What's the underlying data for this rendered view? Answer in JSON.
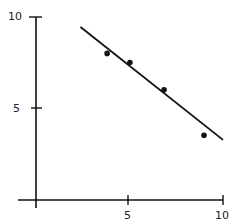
{
  "chart_data": {
    "type": "scatter",
    "title": "",
    "xlabel": "",
    "ylabel": "",
    "xlim": [
      0,
      10
    ],
    "ylim": [
      0,
      10
    ],
    "grid": false,
    "x_ticks": [
      "5",
      "10"
    ],
    "y_ticks": [
      "5",
      "10"
    ],
    "series": [
      {
        "name": "points",
        "x": [
          3.9,
          5.1,
          6.9,
          9.0
        ],
        "y": [
          8.0,
          7.5,
          6.0,
          3.5
        ]
      }
    ],
    "fit_line": {
      "x": [
        2.5,
        10.0
      ],
      "y": [
        9.45,
        3.25
      ]
    },
    "colors": {
      "ink": "#111111",
      "background": "#ffffff"
    }
  }
}
